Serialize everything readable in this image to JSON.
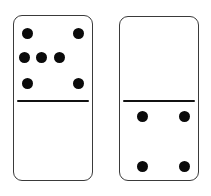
{
  "scene": {
    "title": "Domino pair illustration",
    "background_color": "#ffffff",
    "tile_border_color": "#3a3a3a",
    "tile_face_color": "#ffffff",
    "pip_color": "#0a0a0a",
    "divider_color": "#111111",
    "orientation": "vertical",
    "tile_count": 2,
    "total_pips": 11
  },
  "dominoes": [
    {
      "id": "left",
      "name": "domino-left",
      "value_label": "7 | 0",
      "top_value": 7,
      "bottom_value": 0,
      "pip_total": 7,
      "geometry": {
        "x": 13,
        "y": 15,
        "width": 80,
        "height": 166,
        "radius": 9,
        "divider_y": 100
      },
      "top_pips": [
        {
          "x": 27,
          "y": 33
        },
        {
          "x": 78,
          "y": 33
        },
        {
          "x": 24,
          "y": 57
        },
        {
          "x": 41,
          "y": 57
        },
        {
          "x": 59,
          "y": 57
        },
        {
          "x": 27,
          "y": 83
        },
        {
          "x": 78,
          "y": 83
        }
      ],
      "bottom_pips": []
    },
    {
      "id": "right",
      "name": "domino-right",
      "value_label": "0 | 4",
      "top_value": 0,
      "bottom_value": 4,
      "pip_total": 4,
      "geometry": {
        "x": 119,
        "y": 16,
        "width": 80,
        "height": 165,
        "radius": 9,
        "divider_y": 100
      },
      "top_pips": [],
      "bottom_pips": [
        {
          "x": 142,
          "y": 116
        },
        {
          "x": 184,
          "y": 116
        },
        {
          "x": 142,
          "y": 166
        },
        {
          "x": 184,
          "y": 166
        }
      ]
    }
  ],
  "pip_style": {
    "diameter": 11
  }
}
